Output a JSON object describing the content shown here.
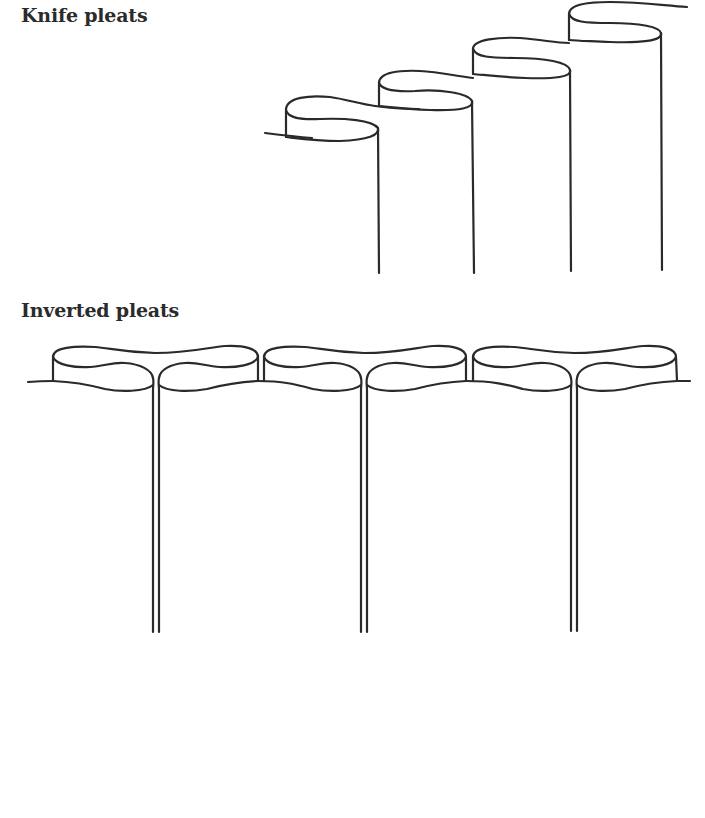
{
  "sections": {
    "knife": {
      "title": "Knife pleats"
    },
    "inverted": {
      "title": "Inverted pleats"
    }
  },
  "colors": {
    "line": "#2a2a2a",
    "text": "#2b2b2b",
    "background": "#ffffff"
  },
  "diagrams": {
    "knife_pleats": {
      "pleat_count": 4,
      "pleats": [
        {
          "left_x": 286,
          "right_x": 379,
          "top_y": 97,
          "bottom_y": 273
        },
        {
          "left_x": 379,
          "right_x": 474,
          "top_y": 72,
          "bottom_y": 273
        },
        {
          "left_x": 473,
          "right_x": 571,
          "top_y": 39,
          "bottom_y": 271
        },
        {
          "left_x": 569,
          "right_x": 662,
          "top_y": 4,
          "bottom_y": 270
        }
      ]
    },
    "inverted_pleats": {
      "pleat_count": 3,
      "pleats": [
        {
          "center_x": 156,
          "bottom_y": 632
        },
        {
          "center_x": 364,
          "bottom_y": 632
        },
        {
          "center_x": 574,
          "bottom_y": 631
        }
      ],
      "baseline_y": 382,
      "left_edge_x": 28,
      "right_edge_x": 690
    }
  }
}
